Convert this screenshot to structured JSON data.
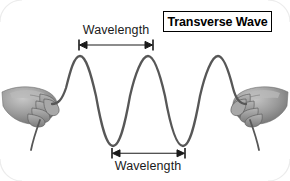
{
  "figure": {
    "width": 290,
    "height": 181,
    "background_color": "#ffffff",
    "title_box": {
      "label": "Transverse Wave",
      "border_color": "#000000",
      "text_color": "#000000"
    },
    "annotations": {
      "wavelength_top_label": "Wavelength",
      "wavelength_bottom_label": "Wavelength",
      "text_color": "#1a1a1a",
      "arrow_color": "#1a1a1a"
    },
    "wave": {
      "stroke_color": "#575757",
      "stroke_width": 2.3,
      "peaks_x": [
        80,
        148,
        218
      ],
      "troughs_x": [
        113,
        183
      ],
      "crest_y": 55,
      "trough_y": 147,
      "midline_y": 101,
      "wavelength_px": 69
    },
    "hands": {
      "left": {
        "name": "left-hand-gripping-rope",
        "skin_color": "#8e8e8e"
      },
      "right": {
        "name": "right-hand-gripping-rope",
        "skin_color": "#8e8e8e"
      }
    },
    "measure_top": {
      "x_start": 79,
      "x_end": 153,
      "y": 45,
      "description": "crest-to-crest wavelength"
    },
    "measure_bottom": {
      "x_start": 112,
      "x_end": 185,
      "y": 153,
      "description": "trough-to-trough wavelength"
    }
  }
}
